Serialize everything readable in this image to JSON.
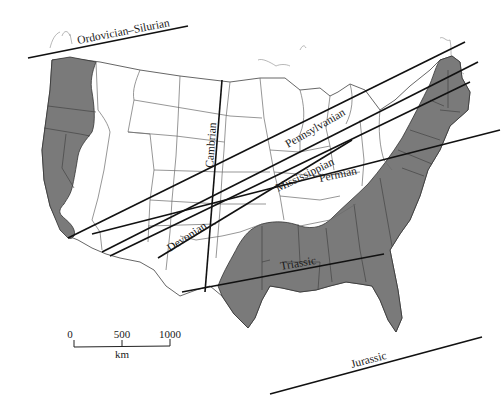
{
  "figure": {
    "type": "map",
    "region": "Contiguous United States",
    "shading_color": "#7a7a7a",
    "line_color": "#111111"
  },
  "periods": [
    {
      "name": "Ordovician–Silurian",
      "label_pos": [
        120,
        37
      ],
      "label_angle": -11
    },
    {
      "name": "Cambrian",
      "label_pos": [
        214,
        148
      ],
      "label_angle": -87
    },
    {
      "name": "Pennsylvanian",
      "label_pos": [
        298,
        126
      ],
      "label_angle": -29
    },
    {
      "name": "Mississippian",
      "label_pos": [
        275,
        170
      ],
      "label_angle": -25
    },
    {
      "name": "Permian",
      "label_pos": [
        330,
        164
      ],
      "label_angle": -13
    },
    {
      "name": "Devonian",
      "label_pos": [
        175,
        248
      ],
      "label_angle": -35
    },
    {
      "name": "Triassic",
      "label_pos": [
        290,
        262
      ],
      "label_angle": -10
    },
    {
      "name": "Jurassic",
      "label_pos": [
        360,
        361
      ],
      "label_angle": -14
    }
  ],
  "scale_bar": {
    "ticks": [
      "0",
      "500",
      "1000"
    ],
    "unit": "km"
  }
}
